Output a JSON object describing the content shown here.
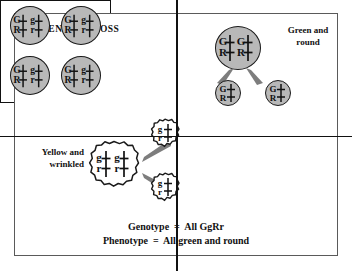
{
  "figure": {
    "title": "PARENTAL CROSS",
    "labels": {
      "green_round": "Green and\nround",
      "yellow_wrinkled": "Yellow and\nwrinkled"
    },
    "conclusion": {
      "genotype": "Genotype  =  All GgRr",
      "phenotype": "Phenotype  =  All green and round"
    }
  },
  "parents": {
    "green_round_parent": {
      "name": "green-round-parent",
      "fill": "#b8b8b8",
      "shape": "round",
      "chromosomes": [
        {
          "top": "G",
          "bottom": "R"
        },
        {
          "top": "G",
          "bottom": "R"
        }
      ]
    },
    "yellow_wrinkled_parent": {
      "name": "yellow-wrinkled-parent",
      "fill": "#ffffff",
      "shape": "wrinkled",
      "chromosomes": [
        {
          "top": "g",
          "bottom": "r"
        },
        {
          "top": "g",
          "bottom": "r"
        }
      ]
    }
  },
  "gametes": {
    "green_round": [
      {
        "chromosomes": [
          {
            "top": "G",
            "bottom": "R"
          }
        ]
      },
      {
        "chromosomes": [
          {
            "top": "G",
            "bottom": "R"
          }
        ]
      }
    ],
    "yellow_wrinkled": [
      {
        "chromosomes": [
          {
            "top": "g",
            "bottom": "r"
          }
        ]
      },
      {
        "chromosomes": [
          {
            "top": "g",
            "bottom": "r"
          }
        ]
      }
    ]
  },
  "punnett_square": {
    "rows": 2,
    "cols": 2,
    "offspring": [
      {
        "cell": "top-left",
        "chromosomes": [
          {
            "top": "G",
            "bottom": "R"
          },
          {
            "top": "g",
            "bottom": "r"
          }
        ]
      },
      {
        "cell": "top-right",
        "chromosomes": [
          {
            "top": "G",
            "bottom": "R"
          },
          {
            "top": "g",
            "bottom": "r"
          }
        ]
      },
      {
        "cell": "bottom-left",
        "chromosomes": [
          {
            "top": "G",
            "bottom": "R"
          },
          {
            "top": "g",
            "bottom": "r"
          }
        ]
      },
      {
        "cell": "bottom-right",
        "chromosomes": [
          {
            "top": "G",
            "bottom": "R"
          },
          {
            "top": "g",
            "bottom": "r"
          }
        ]
      }
    ]
  },
  "colors": {
    "cell_gray": "#b8b8b8",
    "outline": "#1a1a1a",
    "arrow_gray": "#7d7d7d",
    "frame": "#5a5a5a"
  }
}
